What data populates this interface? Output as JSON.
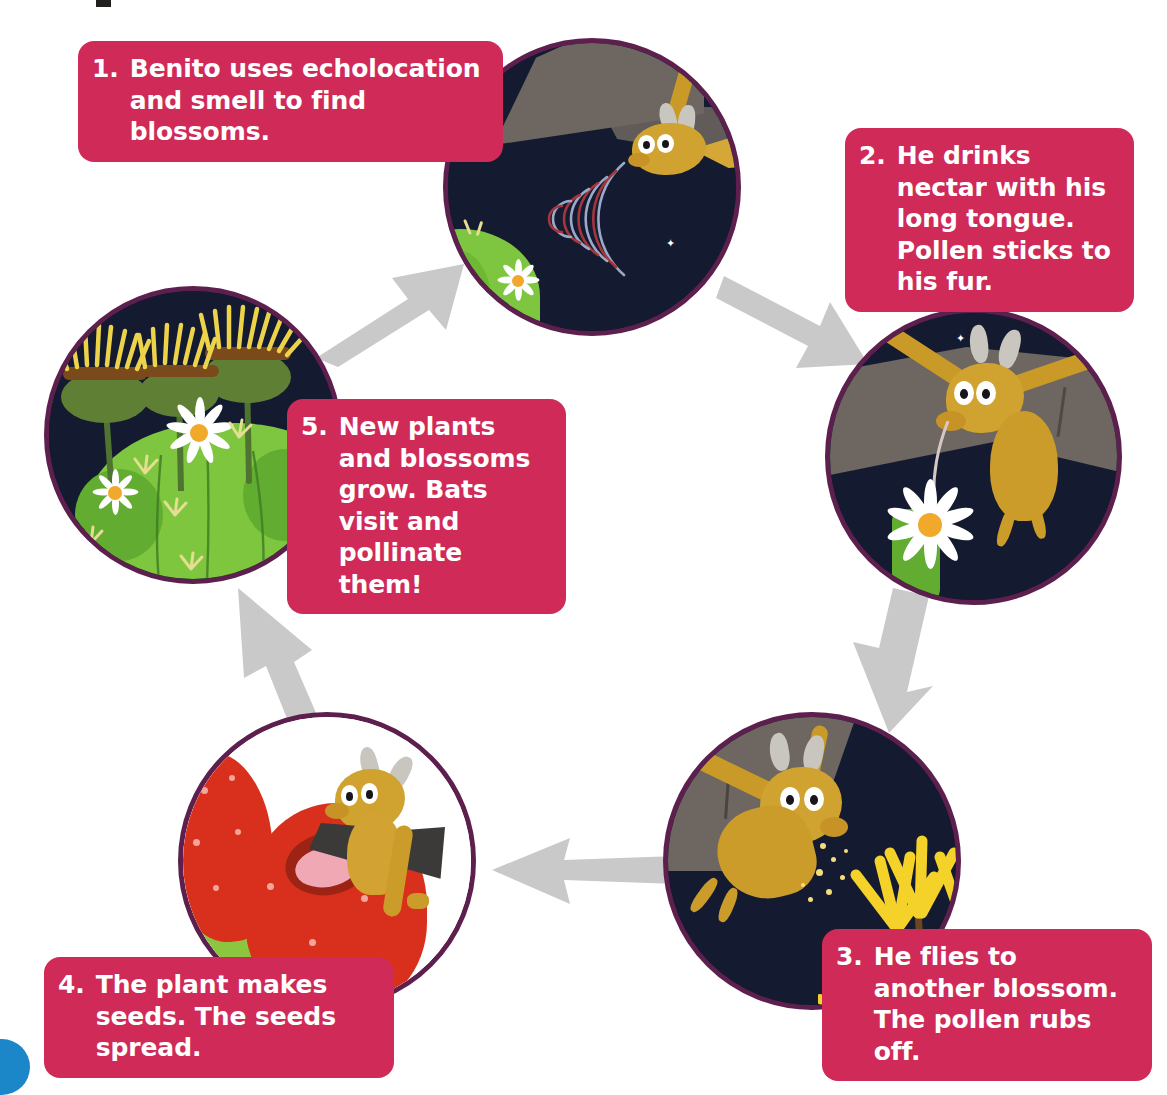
{
  "diagram": {
    "type": "cycle-diagram",
    "steps": [
      {
        "number": "1.",
        "text": "Benito uses echolocation and smell to find blossoms.",
        "scene": "night-desert-bat-echolocation"
      },
      {
        "number": "2.",
        "text": "He drinks nectar with his long tongue. Pollen sticks to his fur.",
        "scene": "bat-drinking-nectar-from-white-blossom"
      },
      {
        "number": "3.",
        "text": "He flies to another blossom. The pollen rubs off.",
        "scene": "bat-flying-to-yellow-blossoms-with-pollen"
      },
      {
        "number": "4.",
        "text": "The plant makes seeds. The seeds spread.",
        "scene": "bat-eating-red-cactus-fruit"
      },
      {
        "number": "5.",
        "text": "New plants and blossoms grow. Bats visit and pollinate them!",
        "scene": "green-cactus-with-yellow-blooms-and-white-flowers"
      }
    ],
    "arrows": [
      {
        "from": "5",
        "to": "1",
        "direction": "up-right"
      },
      {
        "from": "1",
        "to": "2",
        "direction": "down-right"
      },
      {
        "from": "2",
        "to": "3",
        "direction": "down"
      },
      {
        "from": "3",
        "to": "4",
        "direction": "left"
      },
      {
        "from": "4",
        "to": "5",
        "direction": "up"
      }
    ],
    "colors": {
      "callout_pink": "#d02a58",
      "callout_text": "#ffffff",
      "circle_ring_purple": "#5d1f4e",
      "night_sky": "#141b31",
      "arrow_grey": "#c9c9c9",
      "bat_fur": "#cb9c2a",
      "cactus_green": "#7ec63f",
      "blossom_yellow": "#f4d22a",
      "fruit_red": "#d8301c",
      "mountain_grey": "#6e6660",
      "corner_dot_blue": "#1b86c8"
    }
  }
}
